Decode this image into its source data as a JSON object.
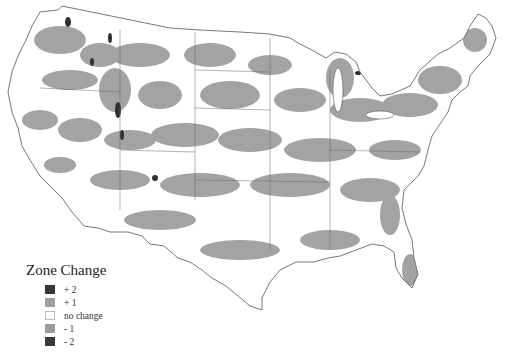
{
  "map": {
    "subject": "Contiguous United States zone change map",
    "colors": {
      "background": "#ffffff",
      "no_change": "#ffffff",
      "plus1": "#a3a3a3",
      "minus1": "#a3a3a3",
      "plus2": "#303030",
      "minus2": "#303030",
      "boundary": "#555555"
    }
  },
  "legend": {
    "title": "Zone Change",
    "items": [
      {
        "label": "+ 2",
        "color": "#353535"
      },
      {
        "label": "+ 1",
        "color": "#a0a0a0"
      },
      {
        "label": "no change",
        "color": "#ffffff"
      },
      {
        "label": "- 1",
        "color": "#9a9a9a"
      },
      {
        "label": "- 2",
        "color": "#3a3a3a"
      }
    ]
  }
}
